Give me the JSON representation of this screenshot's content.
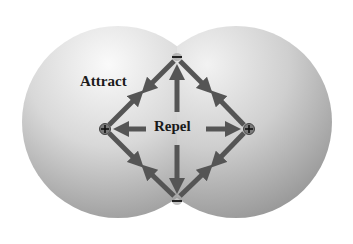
{
  "diagram": {
    "labels": {
      "attract": "Attract",
      "repel": "Repel"
    },
    "charges": {
      "top": "−",
      "bottom": "−",
      "left": "+",
      "right": "+"
    },
    "colors": {
      "sphere_light": "#f4f4f4",
      "sphere_dark": "#8a8a8a",
      "arrow": "#555555",
      "text": "#1a1a1a",
      "background": "#ffffff"
    }
  }
}
